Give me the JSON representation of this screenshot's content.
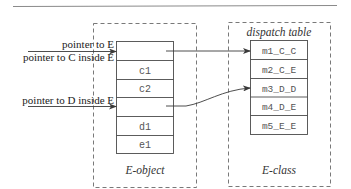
{
  "diagram": {
    "type": "object-layout",
    "colors": {
      "line": "#4a4a4a",
      "dashed": "#6a6a6a",
      "cell_text": "#555555",
      "label_text": "#222222",
      "rule": "#8a8a8a"
    },
    "pointers": [
      {
        "label": "pointer to E"
      },
      {
        "label": "pointer to C inside E"
      },
      {
        "label": "pointer to D inside E"
      }
    ],
    "e_object": {
      "caption": "E-object",
      "cells": [
        "",
        "c1",
        "c2",
        "",
        "d1",
        "e1"
      ]
    },
    "e_class": {
      "caption": "E-class",
      "table_title": "dispatch table",
      "entries": [
        "m1_C_C",
        "m2_C_E",
        "m3_D_D",
        "m4_D_E",
        "m5_E_E"
      ]
    },
    "edges": [
      {
        "from": "e_object.cells.0",
        "to": "e_class.entries.0"
      },
      {
        "from": "e_object.cells.3",
        "to": "e_class.entries.2"
      },
      {
        "from": "pointers.0",
        "to": "e_object.cells.0"
      },
      {
        "from": "pointers.1",
        "to": "e_object.cells.0"
      },
      {
        "from": "pointers.2",
        "to": "e_object.cells.3"
      }
    ]
  }
}
